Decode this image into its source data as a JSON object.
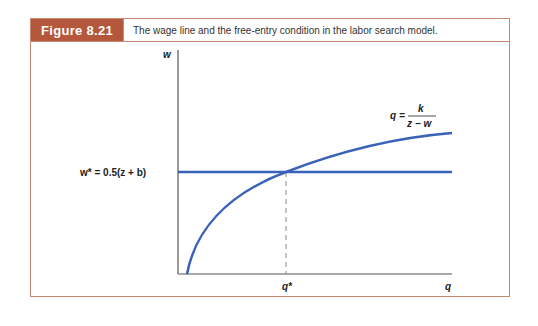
{
  "figure": {
    "label": "Figure 8.21",
    "caption": "The wage line and the free-entry condition in the labor search model.",
    "accent_color": "#b5573a",
    "border_color": "#c98a72",
    "curve_color": "#3a62b8"
  },
  "diagram": {
    "y_axis_label": "w",
    "x_axis_label": "q",
    "wage_line_label": "w* = 0.5(z + b)",
    "curve_label_lhs": "q =",
    "curve_label_num": "k",
    "curve_label_den": "z − w",
    "equilibrium_label": "q*"
  }
}
